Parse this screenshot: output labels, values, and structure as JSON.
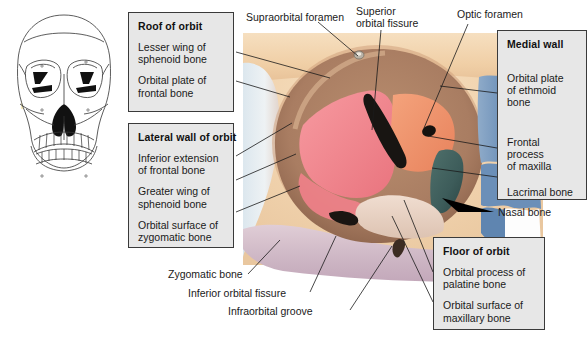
{
  "figure": {
    "view": "anterior view of right orbit"
  },
  "boxes": [
    {
      "id": "roof-of-orbit",
      "title": "Roof of orbit",
      "items": [
        "Lesser wing of\nsphenoid bone",
        "Orbital plate of\nfrontal bone"
      ]
    },
    {
      "id": "lateral-wall-of-orbit",
      "title": "Lateral wall of orbit",
      "items": [
        "Inferior extension\nof frontal bone",
        "Greater wing of\nsphenoid bone",
        "Orbital surface of\nzygomatic bone"
      ]
    },
    {
      "id": "medial-wall",
      "title": "Medial wall",
      "items": [
        "Orbital plate\nof ethmoid bone",
        "Frontal process\nof maxilla",
        "Lacrimal bone"
      ]
    },
    {
      "id": "floor-of-orbit",
      "title": "Floor of orbit",
      "items": [
        "Orbital process of\npalatine bone",
        "Orbital surface of\nmaxillary bone"
      ]
    }
  ],
  "free_labels": [
    {
      "id": "supraorbital-foramen",
      "text": "Supraorbital foramen"
    },
    {
      "id": "superior-orbital-fissure",
      "text": "Superior\norbital fissure"
    },
    {
      "id": "optic-foramen",
      "text": "Optic foramen"
    },
    {
      "id": "nasal-bone",
      "text": "Nasal bone"
    },
    {
      "id": "zygomatic-bone",
      "text": "Zygomatic bone"
    },
    {
      "id": "inferior-orbital-fissure",
      "text": "Inferior orbital fissure"
    },
    {
      "id": "infraorbital-groove",
      "text": "Infraorbital groove"
    }
  ],
  "colors": {
    "box_fill": "#e7e7e7",
    "box_border": "#3a3a3a",
    "text": "#1a1a1a",
    "leader_line": "#1a1a1a",
    "sphenoid_pink": "#ef8089",
    "orbital_orange": "#f0936b",
    "ethmoid_blue": "#6b8fb8",
    "lacrimal_teal": "#3d5c5a",
    "bone_tan": "#c9a488",
    "zygomatic_mauve": "#cdb6c4",
    "skin_cream": "#f2d9b4",
    "highlight_yellow": "#f5ecc0"
  }
}
